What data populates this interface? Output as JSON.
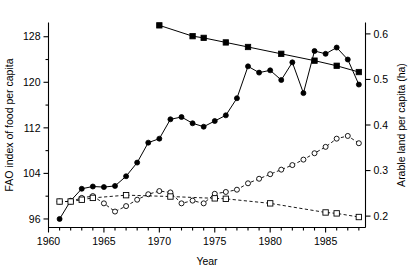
{
  "chart_data": {
    "type": "line",
    "title": "",
    "xlabel": "Year",
    "ylabel": "FAO index of food per capita",
    "y2label": "Arable land per capita (ha)",
    "xlim": [
      1960,
      1988.6
    ],
    "ylim": [
      94.5,
      130.5
    ],
    "y2lim": [
      0.175,
      0.625
    ],
    "xticks": [
      1960,
      1965,
      1970,
      1975,
      1980,
      1985
    ],
    "xticklabels": [
      "1960",
      "1965",
      "1970",
      "1975",
      "1980",
      "1985"
    ],
    "x_minor_tick_step": 1,
    "yticks": [
      96,
      104,
      112,
      120,
      128
    ],
    "yticklabels": [
      "96",
      "104",
      "112",
      "120",
      "128"
    ],
    "y_minor_tick_step": 4,
    "y2ticks": [
      0.2,
      0.3,
      0.4,
      0.5,
      0.6
    ],
    "y2ticklabels": [
      "0.2",
      "0.3",
      "0.4",
      "0.5",
      "0.6"
    ],
    "grid": false,
    "legend": "none",
    "series": [
      {
        "name": "FAO index of food per capita (filled circles)",
        "axis": "left",
        "marker": "filled-circle",
        "linestyle": "solid",
        "x": [
          1961,
          1962,
          1963,
          1964,
          1965,
          1966,
          1967,
          1968,
          1969,
          1970,
          1971,
          1972,
          1973,
          1974,
          1975,
          1976,
          1977,
          1978,
          1979,
          1980,
          1981,
          1982,
          1983,
          1984,
          1985,
          1986,
          1987,
          1988
        ],
        "values": [
          96.0,
          99.2,
          101.3,
          101.7,
          101.6,
          101.8,
          103.5,
          105.9,
          109.4,
          110.1,
          113.5,
          113.9,
          112.8,
          112.2,
          113.2,
          114.2,
          117.2,
          122.8,
          121.7,
          122.1,
          120.4,
          123.5,
          118.1,
          125.5,
          125.0,
          126.1,
          124.0,
          119.6
        ]
      },
      {
        "name": "FAO index of food per capita (filled squares, trend)",
        "axis": "left",
        "marker": "filled-square",
        "linestyle": "solid",
        "x": [
          1970,
          1973,
          1974,
          1976,
          1978,
          1981,
          1984,
          1986,
          1988
        ],
        "values": [
          130.0,
          128.1,
          127.8,
          127.0,
          126.2,
          125.0,
          123.8,
          122.9,
          121.8
        ]
      },
      {
        "name": "Arable land per capita (open circles)",
        "axis": "right",
        "marker": "open-circle",
        "linestyle": "dashed",
        "x": [
          1961,
          1962,
          1963,
          1964,
          1965,
          1966,
          1967,
          1968,
          1969,
          1970,
          1971,
          1972,
          1973,
          1974,
          1975,
          1976,
          1977,
          1978,
          1979,
          1980,
          1981,
          1982,
          1983,
          1984,
          1985,
          1986,
          1987,
          1988
        ],
        "values": [
          0.232,
          0.232,
          0.24,
          0.244,
          0.228,
          0.21,
          0.222,
          0.236,
          0.248,
          0.255,
          0.252,
          0.228,
          0.234,
          0.228,
          0.249,
          0.253,
          0.258,
          0.272,
          0.282,
          0.292,
          0.302,
          0.312,
          0.324,
          0.338,
          0.352,
          0.37,
          0.376,
          0.36
        ]
      },
      {
        "name": "Arable land per capita (open squares, trend)",
        "axis": "right",
        "marker": "open-square",
        "linestyle": "dashed",
        "x": [
          1961,
          1962,
          1963,
          1964,
          1967,
          1971,
          1975,
          1976,
          1980,
          1985,
          1986,
          1988
        ],
        "values": [
          0.232,
          0.232,
          0.236,
          0.24,
          0.246,
          0.243,
          0.239,
          0.238,
          0.228,
          0.208,
          0.206,
          0.198
        ]
      }
    ]
  }
}
